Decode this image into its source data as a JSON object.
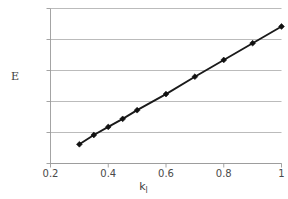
{
  "chart_data": {
    "type": "line",
    "title": "",
    "xlabel": "k",
    "xlabel_sub": "l",
    "ylabel": "E",
    "xlim": [
      0.2,
      1.0
    ],
    "ylim": [
      0.5,
      3.0
    ],
    "grid": true,
    "grid_axis": "y",
    "legend": "none",
    "marker": "diamond",
    "line_color": "#1a1a1a",
    "grid_color": "#aaaaaa",
    "axis_color": "#9a9a9a",
    "background": "#ffffff",
    "xticks": [
      0.2,
      0.4,
      0.6,
      0.8,
      1
    ],
    "xtick_labels": [
      "0.2",
      "0.4",
      "0.6",
      "0.8",
      "1"
    ],
    "yticks": [
      0.5,
      1,
      1.5,
      2,
      2.5,
      3
    ],
    "ytick_labels": [
      "0.5",
      "1",
      "1.5",
      "2",
      "2.5",
      "3"
    ],
    "x": [
      0.3,
      0.35,
      0.4,
      0.45,
      0.5,
      0.6,
      0.7,
      0.8,
      0.9,
      1.0
    ],
    "values": [
      0.81,
      0.96,
      1.09,
      1.22,
      1.36,
      1.62,
      1.9,
      2.17,
      2.44,
      2.71
    ],
    "series": [
      {
        "name": "E",
        "x": [
          0.3,
          0.35,
          0.4,
          0.45,
          0.5,
          0.6,
          0.7,
          0.8,
          0.9,
          1.0
        ],
        "values": [
          0.81,
          0.96,
          1.09,
          1.22,
          1.36,
          1.62,
          1.9,
          2.17,
          2.44,
          2.71
        ]
      }
    ]
  }
}
